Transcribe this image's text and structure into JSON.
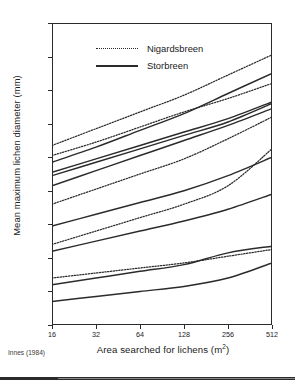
{
  "chart_data": {
    "type": "line",
    "title": "",
    "xlabel": "Area searched for lichens (m²)",
    "ylabel": "Mean maximum lichen diameter (mm)",
    "x_scale": "log2",
    "x": [
      16,
      32,
      64,
      128,
      256,
      512
    ],
    "xticklabels": [
      "16",
      "32",
      "64",
      "128",
      "256",
      "512"
    ],
    "xlim": [
      16,
      512
    ],
    "ylim": [
      10,
      100
    ],
    "yticks": [
      10,
      20,
      30,
      40,
      50,
      60,
      70,
      80,
      90,
      100
    ],
    "yticklabels": [
      "10",
      "20",
      "30",
      "40",
      "50",
      "60",
      "70",
      "80",
      "90",
      "100"
    ],
    "grid": false,
    "legend_position": "upper-left-inside",
    "legend": [
      {
        "label": "Nigardsbreen",
        "style": "dotted"
      },
      {
        "label": "Storbreen",
        "style": "solid"
      }
    ],
    "series": [
      {
        "name": "Nigardsbreen 1",
        "group": "Nigardsbreen",
        "style": "dotted",
        "values": [
          63.5,
          68.5,
          73.5,
          78.5,
          84.5,
          90.5
        ]
      },
      {
        "name": "Storbreen 1",
        "group": "Storbreen",
        "style": "solid",
        "values": [
          58.5,
          63.0,
          68.0,
          73.0,
          79.0,
          85.0
        ]
      },
      {
        "name": "Nigardsbreen 2",
        "group": "Nigardsbreen",
        "style": "dotted",
        "values": [
          60.5,
          64.5,
          69.0,
          73.5,
          77.5,
          82.0
        ]
      },
      {
        "name": "Storbreen 2",
        "group": "Storbreen",
        "style": "solid",
        "values": [
          55.5,
          59.5,
          63.5,
          67.5,
          71.5,
          76.5
        ]
      },
      {
        "name": "Storbreen 3",
        "group": "Storbreen",
        "style": "solid",
        "values": [
          54.5,
          58.5,
          62.5,
          66.5,
          70.5,
          76.0
        ]
      },
      {
        "name": "Storbreen 4",
        "group": "Storbreen",
        "style": "solid",
        "values": [
          51.5,
          56.0,
          60.5,
          65.0,
          69.5,
          74.5
        ]
      },
      {
        "name": "Nigardsbreen 3",
        "group": "Nigardsbreen",
        "style": "dotted",
        "values": [
          46.0,
          50.5,
          55.0,
          59.5,
          65.5,
          72.0
        ]
      },
      {
        "name": "Storbreen 5",
        "group": "Storbreen",
        "style": "solid",
        "values": [
          39.5,
          43.0,
          46.5,
          50.0,
          54.5,
          60.0
        ]
      },
      {
        "name": "Nigardsbreen 4",
        "group": "Nigardsbreen",
        "style": "dotted",
        "values": [
          34.0,
          38.0,
          42.0,
          46.0,
          51.5,
          62.5
        ]
      },
      {
        "name": "Storbreen 6",
        "group": "Storbreen",
        "style": "solid",
        "values": [
          32.0,
          35.0,
          38.0,
          41.0,
          44.5,
          49.0
        ]
      },
      {
        "name": "Nigardsbreen 5",
        "group": "Nigardsbreen",
        "style": "dotted",
        "values": [
          24.0,
          25.5,
          27.0,
          28.5,
          30.5,
          32.5
        ]
      },
      {
        "name": "Storbreen 7",
        "group": "Storbreen",
        "style": "solid",
        "values": [
          22.0,
          24.0,
          26.0,
          28.0,
          31.5,
          33.5
        ]
      },
      {
        "name": "Storbreen 8",
        "group": "Storbreen",
        "style": "solid",
        "values": [
          17.0,
          18.5,
          20.0,
          21.5,
          24.0,
          28.5
        ]
      }
    ],
    "source_note": "Innes (1984)",
    "colors": {
      "line": "#2b2b2b",
      "axis": "#2b2b2b",
      "background": "#ffffff"
    }
  }
}
